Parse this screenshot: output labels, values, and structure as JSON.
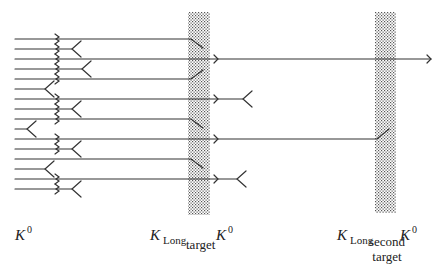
{
  "diagram": {
    "colors": {
      "line": "#333333",
      "target_dots": "#555555",
      "background": "#ffffff"
    },
    "beam_start_x": 15,
    "kink_x": 57,
    "targets": [
      {
        "id": "target",
        "x": 188,
        "y": 12,
        "width": 22,
        "height": 203,
        "caption": "target"
      },
      {
        "id": "second-target",
        "x": 375,
        "y": 12,
        "width": 21,
        "height": 201,
        "caption_lines": [
          "second",
          "target"
        ]
      }
    ],
    "beams": [
      {
        "y": 39,
        "kink": true,
        "end": "bend-down",
        "end_x": 188
      },
      {
        "y": 49,
        "kink": true,
        "end": "fork",
        "end_x": 72
      },
      {
        "y": 59,
        "kink": true,
        "end": "arrow-through",
        "arrow_x": 218,
        "end_x": 428
      },
      {
        "y": 69,
        "kink": true,
        "end": "fork",
        "end_x": 82
      },
      {
        "y": 79,
        "kink": true,
        "end": "bend-up",
        "end_x": 188
      },
      {
        "y": 89,
        "kink": false,
        "end": "fork",
        "end_x": 45
      },
      {
        "y": 99,
        "kink": true,
        "end": "arrow-fork",
        "arrow_x": 218,
        "end_x": 243
      },
      {
        "y": 109,
        "kink": true,
        "end": "fork",
        "end_x": 72
      },
      {
        "y": 119,
        "kink": true,
        "end": "bend-down",
        "end_x": 188
      },
      {
        "y": 129,
        "kink": false,
        "end": "fork",
        "end_x": 27
      },
      {
        "y": 139,
        "kink": true,
        "end": "arrow-second-bend-up",
        "arrow_x": 218,
        "end_x": 377
      },
      {
        "y": 149,
        "kink": true,
        "end": "fork",
        "end_x": 72
      },
      {
        "y": 159,
        "kink": false,
        "end": "bend-down",
        "end_x": 188
      },
      {
        "y": 169,
        "kink": false,
        "end": "fork",
        "end_x": 45
      },
      {
        "y": 179,
        "kink": true,
        "end": "arrow-fork",
        "arrow_x": 218,
        "end_x": 237
      },
      {
        "y": 189,
        "kink": true,
        "end": "fork",
        "end_x": 72
      }
    ],
    "labels": {
      "k0_left": {
        "base": "K",
        "sup": "0"
      },
      "klong_target": {
        "base": "K",
        "sub": "Long"
      },
      "k0_target": {
        "base": "K",
        "sup": "0"
      },
      "klong_second": {
        "base": "K",
        "sub": "Long"
      },
      "k0_second": {
        "base": "K",
        "sup": "0"
      },
      "target_caption": "target",
      "second_target_caption_1": "second",
      "second_target_caption_2": "target"
    }
  }
}
